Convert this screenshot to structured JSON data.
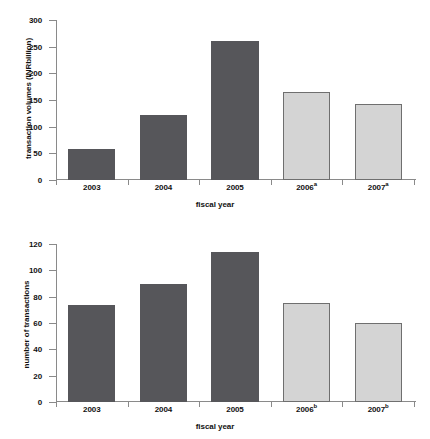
{
  "chart_data": [
    {
      "id": "transaction-volumes",
      "type": "bar",
      "title": "",
      "xlabel": "fiscal year",
      "ylabel": "transaction volumes (INRbillion)",
      "categories": [
        "2003",
        "2004",
        "2005",
        "2006",
        "2007"
      ],
      "category_labels": [
        "2003",
        "2004",
        "2005",
        "2006a",
        "2007a"
      ],
      "category_footnotes": [
        "",
        "",
        "",
        "a",
        "a"
      ],
      "values": [
        58,
        121,
        261,
        165,
        142
      ],
      "ylim": [
        0,
        300
      ],
      "yticks": [
        0,
        50,
        100,
        150,
        200,
        250,
        300
      ],
      "ytick_labels": [
        "0",
        "50",
        "100",
        "150",
        "200",
        "250",
        "300"
      ],
      "grid": false,
      "legend": "none",
      "bar_styles": [
        "dark",
        "dark",
        "dark",
        "light",
        "light"
      ],
      "colors": {
        "dark": "#56565a",
        "light": "#d4d4d4",
        "light_edge": "#6f6f6f",
        "axis": "#8a8a8a"
      }
    },
    {
      "id": "number-of-transactions",
      "type": "bar",
      "title": "",
      "xlabel": "fiscal year",
      "ylabel": "number of transactions",
      "categories": [
        "2003",
        "2004",
        "2005",
        "2006",
        "2007"
      ],
      "category_labels": [
        "2003",
        "2004",
        "2005",
        "2006b",
        "2007b"
      ],
      "category_footnotes": [
        "",
        "",
        "",
        "b",
        "b"
      ],
      "values": [
        74,
        90,
        114,
        75,
        60
      ],
      "ylim": [
        0,
        120
      ],
      "yticks": [
        0,
        20,
        40,
        60,
        80,
        100,
        120
      ],
      "ytick_labels": [
        "0",
        "20",
        "40",
        "60",
        "80",
        "100",
        "120"
      ],
      "grid": false,
      "legend": "none",
      "bar_styles": [
        "dark",
        "dark",
        "dark",
        "light",
        "light"
      ],
      "colors": {
        "dark": "#56565a",
        "light": "#d4d4d4",
        "light_edge": "#6f6f6f",
        "axis": "#8a8a8a"
      }
    }
  ]
}
